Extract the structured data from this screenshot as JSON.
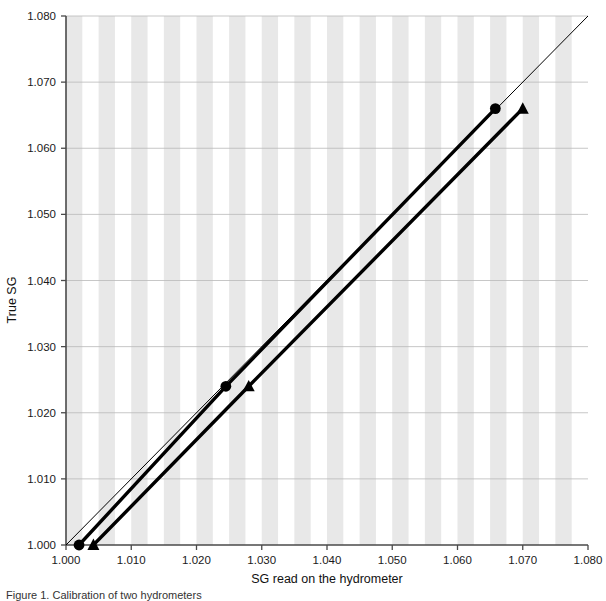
{
  "figure": {
    "caption": "Figure 1.  Calibration of two hydrometers"
  },
  "chart_data": {
    "type": "line",
    "title": "",
    "xlabel": "SG read on the hydrometer",
    "ylabel": "True SG",
    "xlim": [
      1.0,
      1.08
    ],
    "ylim": [
      1.0,
      1.08
    ],
    "xticks": [
      "1.000",
      "1.010",
      "1.020",
      "1.030",
      "1.040",
      "1.050",
      "1.060",
      "1.070",
      "1.080"
    ],
    "yticks": [
      "1.000",
      "1.010",
      "1.020",
      "1.030",
      "1.040",
      "1.050",
      "1.060",
      "1.070",
      "1.080"
    ],
    "xtick_values": [
      1.0,
      1.01,
      1.02,
      1.03,
      1.04,
      1.05,
      1.06,
      1.07,
      1.08
    ],
    "ytick_values": [
      1.0,
      1.01,
      1.02,
      1.03,
      1.04,
      1.05,
      1.06,
      1.07,
      1.08
    ],
    "grid": "horizontal gridlines at each y tick; alternating vertical grey/white bands every 0.0025 SG",
    "legend": "none",
    "band_color": "#e8e8e8",
    "gridline_color": "#b9b9b9",
    "axis_color": "#4a4a4a",
    "series": [
      {
        "name": "reference-line-1to1",
        "style": "thin",
        "marker": "none",
        "x": [
          1.0,
          1.08
        ],
        "y": [
          1.0,
          1.08
        ]
      },
      {
        "name": "hydrometer-circle",
        "style": "thick",
        "marker": "circle",
        "x": [
          1.002,
          1.0245,
          1.0658
        ],
        "y": [
          1.0,
          1.024,
          1.066
        ]
      },
      {
        "name": "hydrometer-triangle",
        "style": "thick",
        "marker": "triangle",
        "x": [
          1.0042,
          1.028,
          1.07
        ],
        "y": [
          1.0,
          1.024,
          1.066
        ]
      }
    ]
  }
}
